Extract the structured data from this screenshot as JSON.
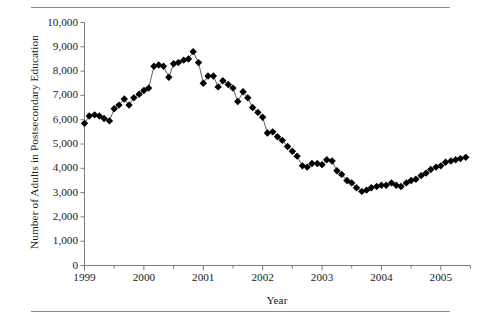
{
  "figure": {
    "type": "line-scatter-chart",
    "top_rule": true,
    "bottom_rule": true
  },
  "chart_data": {
    "type": "line",
    "title": "",
    "xlabel": "Year",
    "ylabel": "Number of Adults in Postsecondary Education",
    "xlim": [
      1999,
      2005.5
    ],
    "ylim": [
      0,
      10000
    ],
    "grid": false,
    "legend": null,
    "marker": "diamond",
    "marker_color": "#000000",
    "line_color": "#4d4d4d",
    "y_ticks": [
      0,
      1000,
      2000,
      3000,
      4000,
      5000,
      6000,
      7000,
      8000,
      9000,
      10000
    ],
    "y_tick_labels": [
      "0",
      "1,000",
      "2,000",
      "3,000",
      "4,000",
      "5,000",
      "6,000",
      "7,000",
      "8,000",
      "9,000",
      "10,000"
    ],
    "x_ticks": [
      1999,
      2000,
      2001,
      2002,
      2003,
      2004,
      2005
    ],
    "x_tick_labels": [
      "1999",
      "2000",
      "2001",
      "2002",
      "2003",
      "2004",
      "2005"
    ],
    "x_minor_tick_step": 0.5,
    "x": [
      1999.0,
      1999.08,
      1999.17,
      1999.25,
      1999.33,
      1999.42,
      1999.5,
      1999.58,
      1999.67,
      1999.75,
      1999.83,
      1999.92,
      2000.0,
      2000.08,
      2000.17,
      2000.25,
      2000.33,
      2000.42,
      2000.5,
      2000.58,
      2000.67,
      2000.75,
      2000.83,
      2000.92,
      2001.0,
      2001.08,
      2001.17,
      2001.25,
      2001.33,
      2001.42,
      2001.5,
      2001.58,
      2001.67,
      2001.75,
      2001.83,
      2001.92,
      2002.0,
      2002.08,
      2002.17,
      2002.25,
      2002.33,
      2002.42,
      2002.5,
      2002.58,
      2002.67,
      2002.75,
      2002.83,
      2002.92,
      2003.0,
      2003.08,
      2003.17,
      2003.25,
      2003.33,
      2003.42,
      2003.5,
      2003.58,
      2003.67,
      2003.75,
      2003.83,
      2003.92,
      2004.0,
      2004.08,
      2004.17,
      2004.25,
      2004.33,
      2004.42,
      2004.5,
      2004.58,
      2004.67,
      2004.75,
      2004.83,
      2004.92,
      2005.0,
      2005.08,
      2005.17,
      2005.25,
      2005.33,
      2005.42
    ],
    "values": [
      5850,
      6150,
      6200,
      6150,
      6050,
      5950,
      6450,
      6600,
      6850,
      6600,
      6900,
      7050,
      7200,
      7300,
      8200,
      8250,
      8200,
      7750,
      8300,
      8350,
      8450,
      8500,
      8800,
      8350,
      7500,
      7800,
      7800,
      7350,
      7600,
      7450,
      7300,
      6750,
      7150,
      6900,
      6500,
      6300,
      6100,
      5450,
      5500,
      5300,
      5150,
      4900,
      4700,
      4500,
      4100,
      4050,
      4200,
      4200,
      4150,
      4350,
      4300,
      3900,
      3750,
      3500,
      3400,
      3200,
      3050,
      3100,
      3200,
      3250,
      3300,
      3300,
      3400,
      3300,
      3250,
      3400,
      3500,
      3550,
      3700,
      3800,
      3950,
      4050,
      4100,
      4250,
      4300,
      4350,
      4400,
      4450
    ]
  }
}
